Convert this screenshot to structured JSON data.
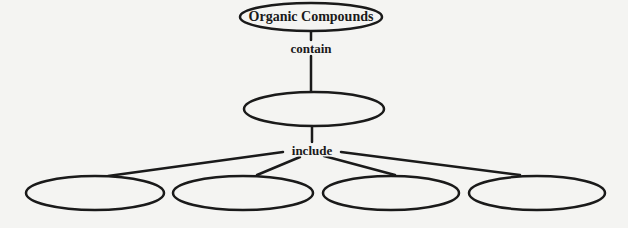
{
  "diagram": {
    "type": "concept-map",
    "colors": {
      "stroke": "#1a1a1a",
      "background": "#f4f4f2"
    },
    "root": {
      "id": "root",
      "label": "Organic Compounds",
      "cx": 311,
      "cy": 17,
      "rx": 71,
      "ry": 14
    },
    "links": [
      {
        "id": "link-contain",
        "label": "contain",
        "x": 311,
        "y": 48
      },
      {
        "id": "link-include",
        "label": "include",
        "x": 312,
        "y": 150
      }
    ],
    "middle": {
      "id": "middle",
      "label": "",
      "cx": 314,
      "cy": 109,
      "rx": 70,
      "ry": 17
    },
    "leaves": [
      {
        "id": "leaf-1",
        "label": "",
        "cx": 95,
        "cy": 193,
        "rx": 69,
        "ry": 17
      },
      {
        "id": "leaf-2",
        "label": "",
        "cx": 243,
        "cy": 193,
        "rx": 70,
        "ry": 17
      },
      {
        "id": "leaf-3",
        "label": "",
        "cx": 391,
        "cy": 193,
        "rx": 68,
        "ry": 17
      },
      {
        "id": "leaf-4",
        "label": "",
        "cx": 537,
        "cy": 193,
        "rx": 68,
        "ry": 17
      }
    ]
  }
}
